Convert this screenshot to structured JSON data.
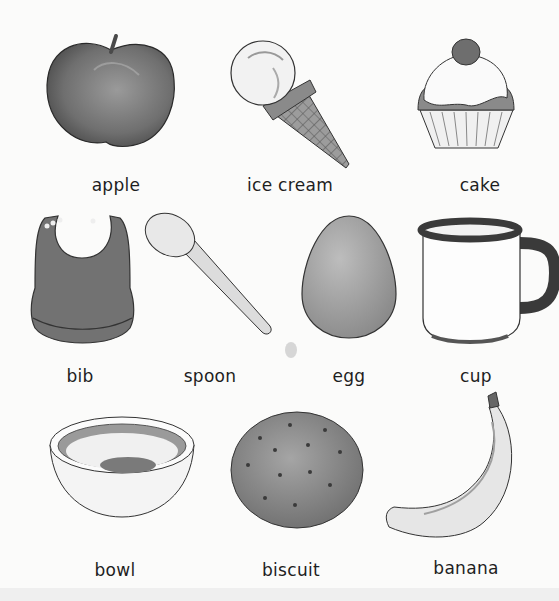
{
  "items": [
    {
      "label": "apple",
      "icon": "apple-icon"
    },
    {
      "label": "ice cream",
      "icon": "ice-cream-icon"
    },
    {
      "label": "cake",
      "icon": "cupcake-icon"
    },
    {
      "label": "bib",
      "icon": "bib-icon"
    },
    {
      "label": "spoon",
      "icon": "spoon-icon"
    },
    {
      "label": "egg",
      "icon": "egg-icon"
    },
    {
      "label": "cup",
      "icon": "cup-icon"
    },
    {
      "label": "bowl",
      "icon": "bowl-icon"
    },
    {
      "label": "biscuit",
      "icon": "biscuit-icon"
    },
    {
      "label": "banana",
      "icon": "banana-icon"
    }
  ],
  "colors": {
    "background": "#fbfbfa",
    "label_text": "#1e1e1e",
    "illustration_dark": "#5a5a5a",
    "illustration_mid": "#8a8a8a",
    "illustration_light": "#d8d8d8"
  }
}
